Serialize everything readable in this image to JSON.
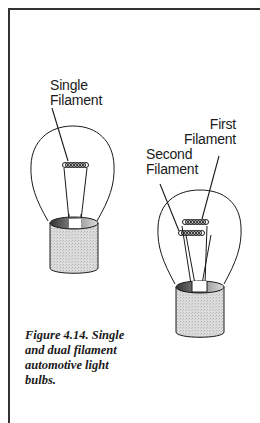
{
  "labels": {
    "single_filament": [
      "Single",
      "Filament"
    ],
    "first_filament": [
      "First",
      "Filament"
    ],
    "second_filament": [
      "Second",
      "Filament"
    ]
  },
  "caption": {
    "figure_number": "Figure 4.14.",
    "text": "Figure 4.14. Single and dual filament automotive light bulbs."
  },
  "colors": {
    "line": "#1a1a1a",
    "base_fill": "#d4d4d4",
    "base_inner": "#555555"
  }
}
